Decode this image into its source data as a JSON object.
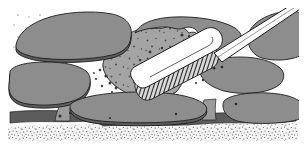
{
  "figure": {
    "width": 306,
    "height": 146
  },
  "palette": {
    "background": "#ffffff",
    "stone_fill": "#8d8d8d",
    "stone_fill_light": "#9a9a9a",
    "stone_edge_shadow": "#5d5d5d",
    "joint_sand_fill": "#a2a2a2",
    "outline": "#1d1d1d",
    "bristle_dark": "#2b2b2b",
    "tool_fill": "#ffffff",
    "bedding_sand": "#f2f2f2",
    "speckle": "#3a3a3a"
  },
  "elements": {
    "stone_top_left": {
      "name": "Top-left flagstone",
      "points": "15,46 26,27 47,19 86,15 112,17 128,26 131,42 127,54 98,59 55,61 25,57"
    },
    "stone_mid_left": {
      "name": "Middle-left flagstone",
      "points": "12,69 38,64 72,64 86,69 87,86 78,98 50,104 22,103 12,96"
    },
    "stone_top_mid": {
      "name": "Upper-middle flagstone",
      "points": "136,24 158,18 196,17 232,23 243,36 236,50 210,57 172,57 142,48"
    },
    "stone_top_right": {
      "name": "Top-right flagstone",
      "points": "248,22 268,14 292,12 296,19 296,52 274,58 252,50"
    },
    "stone_mid_right_upper": {
      "name": "Right upper flagstone",
      "points": "205,63 238,58 266,60 280,69 278,84 252,92 218,90 203,78"
    },
    "stone_mid_right_lower": {
      "name": "Right lower flagstone",
      "points": "233,96 262,93 288,96 294,106 290,118 258,122 232,118 224,107"
    },
    "stone_bottom_mid": {
      "name": "Bottom-middle flagstone",
      "points": "96,104 128,98 168,97 196,102 204,112 198,120 150,124 108,121 95,114"
    },
    "joint_sand_patch": {
      "name": "Loose jointing sand being swept",
      "points": "131,34 148,26 168,27 178,35 186,31 196,35 193,52 181,62 178,80 160,93 140,94 118,86 106,74 110,58 120,46"
    },
    "bedding_layer": {
      "name": "Bedding sand layer",
      "top": 122,
      "height": 24
    },
    "shadow_band": {
      "name": "Dark shadow band under stones",
      "top": 113,
      "height": 11
    }
  },
  "tool": {
    "name": "brush",
    "handle_label": "brush-handle",
    "ferrule_label": "brush-ferrule",
    "bristles_label": "brush-bristles",
    "handle_points": "301,3 306,9 176,80 168,72",
    "head_points": "160,92 136,78 212,38 227,48",
    "bristle_count": 26,
    "bristle_angle_deg": -32
  },
  "speckles": {
    "pebble_count": 22,
    "grain_count": 900
  },
  "labels": {
    "figure_alt": "Brush sweeping jointing sand between paving stones"
  }
}
